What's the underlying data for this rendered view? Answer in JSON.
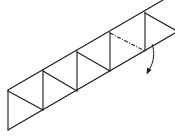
{
  "diagram": {
    "type": "origami-fold-step",
    "colors": {
      "line": "#1a1a1a",
      "background": "#ffffff"
    },
    "outer_edges": {
      "top": [
        [
          8,
          90
        ],
        [
          163,
          0
        ]
      ],
      "bottom": [
        [
          8,
          130
        ],
        [
          175,
          33
        ]
      ],
      "left": [
        [
          8,
          90
        ],
        [
          8,
          130
        ]
      ]
    },
    "verticals": [
      {
        "x": 43,
        "y1": 70,
        "y2": 110
      },
      {
        "x": 77,
        "y1": 51,
        "y2": 91
      },
      {
        "x": 110,
        "y1": 32,
        "y2": 71
      },
      {
        "x": 145,
        "y1": 12,
        "y2": 51
      }
    ],
    "diagonals": [
      [
        [
          8,
          91
        ],
        [
          43,
          110
        ]
      ],
      [
        [
          43,
          71
        ],
        [
          77,
          91
        ]
      ],
      [
        [
          77,
          52
        ],
        [
          110,
          71
        ]
      ],
      [
        [
          145,
          13
        ],
        [
          175,
          30
        ]
      ]
    ],
    "fold_line": {
      "style": "dash-dot",
      "from": [
        110,
        33
      ],
      "to": [
        145,
        51
      ]
    },
    "fold_arrow": {
      "start": [
        152,
        44
      ],
      "end": [
        148,
        73
      ],
      "icon": "curved-arrow-down"
    }
  }
}
